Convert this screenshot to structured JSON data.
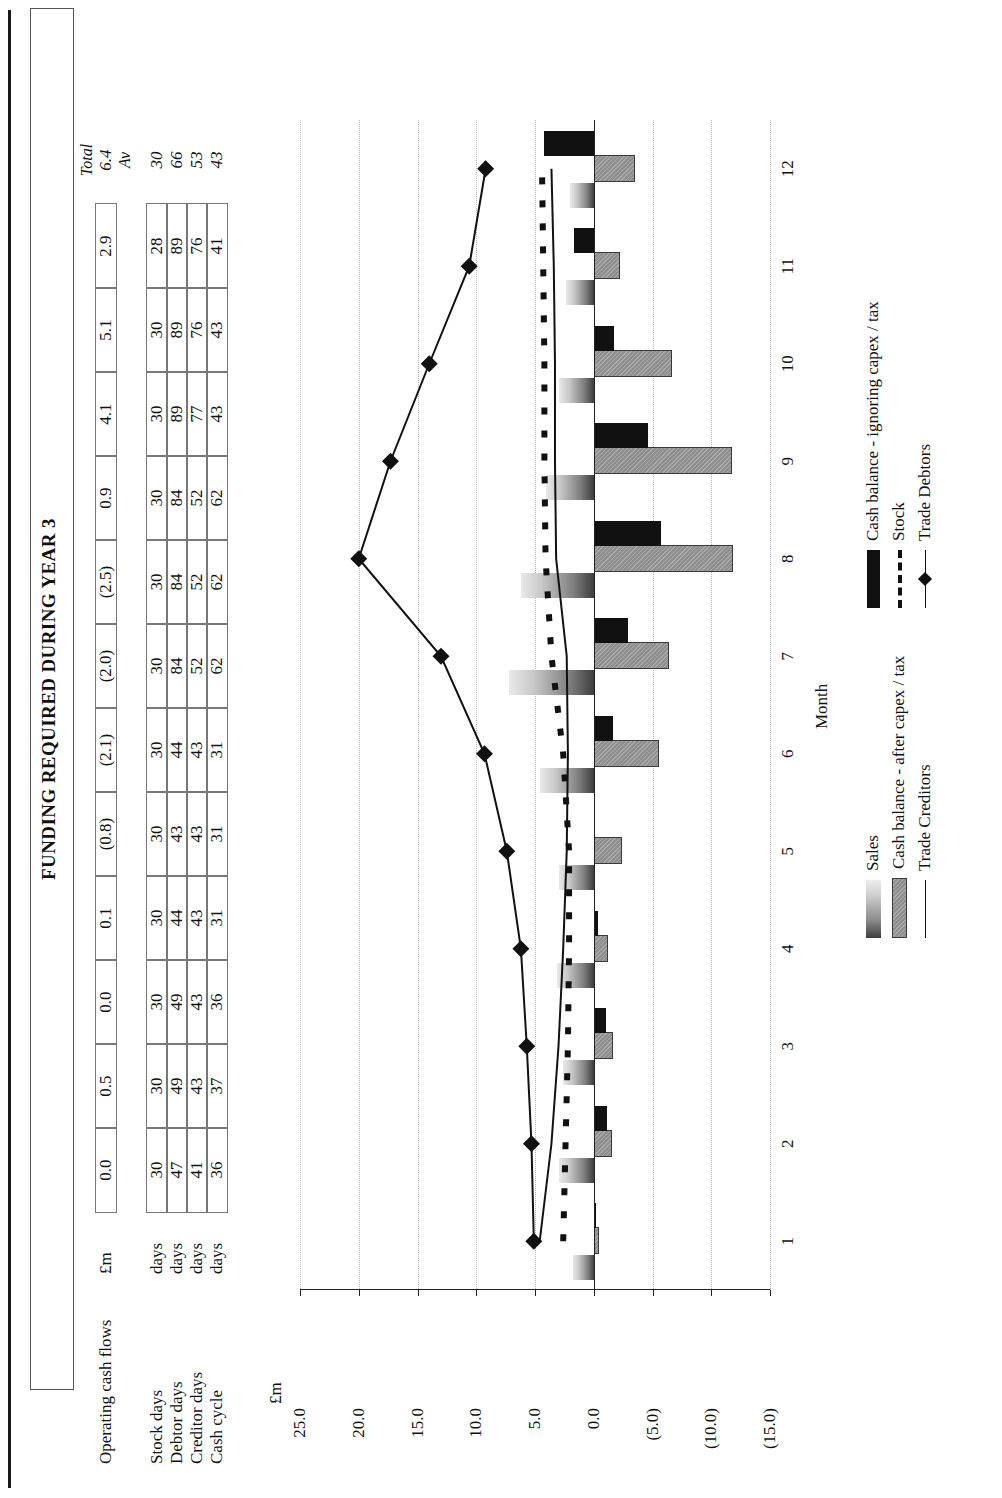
{
  "document": {
    "title": "FUNDING REQUIRED DURING YEAR 3"
  },
  "table": {
    "rows": [
      {
        "label": "Operating cash flows",
        "unit": "£m",
        "values": [
          "0.0",
          "0.5",
          "0.0",
          "0.1",
          "(0.8)",
          "(2.1)",
          "(2.0)",
          "(2.5)",
          "0.9",
          "4.1",
          "5.1",
          "2.9"
        ],
        "total": "6.4",
        "total_header": "Total"
      },
      {
        "label": "Stock days",
        "unit": "days",
        "values": [
          "30",
          "30",
          "30",
          "30",
          "30",
          "30",
          "30",
          "30",
          "30",
          "30",
          "30",
          "28"
        ],
        "total": "30",
        "total_header": "Av"
      },
      {
        "label": "Debtor days",
        "unit": "days",
        "values": [
          "47",
          "49",
          "49",
          "44",
          "43",
          "44",
          "84",
          "84",
          "84",
          "89",
          "89",
          "89"
        ],
        "total": "66",
        "total_header": ""
      },
      {
        "label": "Creditor days",
        "unit": "days",
        "values": [
          "41",
          "43",
          "43",
          "43",
          "43",
          "43",
          "52",
          "52",
          "52",
          "77",
          "76",
          "76"
        ],
        "total": "53",
        "total_header": ""
      },
      {
        "label": "Cash cycle",
        "unit": "days",
        "values": [
          "36",
          "37",
          "36",
          "31",
          "31",
          "31",
          "62",
          "62",
          "62",
          "43",
          "43",
          "41"
        ],
        "total": "43",
        "total_header": ""
      }
    ]
  },
  "chart_data": {
    "type": "bar",
    "title": "FUNDING REQUIRED DURING YEAR 3",
    "xlabel": "Month",
    "ylabel": "£m",
    "categories": [
      "1",
      "2",
      "3",
      "4",
      "5",
      "6",
      "7",
      "8",
      "9",
      "10",
      "11",
      "12"
    ],
    "ytick_labels": [
      "25.0",
      "20.0",
      "15.0",
      "10.0",
      "5.0",
      "0.0",
      "(5.0)",
      "(10.0)",
      "(15.0)"
    ],
    "ytick_values": [
      25,
      20,
      15,
      10,
      5,
      0,
      -5,
      -10,
      -15
    ],
    "ylim": [
      -15,
      25
    ],
    "grid": true,
    "legend_position": "bottom",
    "series": [
      {
        "name": "Sales",
        "type": "bar",
        "style": "gradient-grey",
        "values": [
          1.8,
          3.0,
          2.6,
          3.1,
          3.0,
          4.6,
          7.2,
          6.2,
          4.1,
          3.0,
          2.4,
          2.0
        ]
      },
      {
        "name": "Cash balance - after capex / tax",
        "type": "bar",
        "style": "hatched-grey",
        "values": [
          -0.3,
          -1.4,
          -1.5,
          -1.0,
          -2.2,
          -5.4,
          -6.2,
          -11.7,
          -11.6,
          -6.5,
          -2.1,
          -3.3
        ]
      },
      {
        "name": "Cash balance - ignoring capex / tax",
        "type": "bar",
        "style": "solid-black",
        "values": [
          -0.2,
          -1.1,
          -1.0,
          -0.4,
          0.0,
          -1.6,
          -2.9,
          -5.7,
          -4.6,
          -1.7,
          1.7,
          4.2
        ]
      },
      {
        "name": "Trade Creditors",
        "type": "line",
        "style": "solid",
        "values": [
          4.6,
          3.6,
          3.0,
          2.6,
          2.3,
          2.2,
          2.3,
          3.2,
          3.3,
          3.3,
          3.4,
          3.6
        ]
      },
      {
        "name": "Stock",
        "type": "line",
        "style": "dashed",
        "values": [
          2.6,
          2.4,
          2.2,
          2.1,
          2.1,
          2.6,
          3.6,
          4.1,
          4.2,
          4.2,
          4.3,
          4.4
        ]
      },
      {
        "name": "Trade Debtors",
        "type": "line",
        "style": "solid-diamond",
        "values": [
          5.1,
          5.3,
          5.7,
          6.2,
          7.4,
          9.3,
          13.0,
          20.0,
          17.3,
          14.0,
          10.6,
          9.2
        ]
      }
    ]
  },
  "legend": {
    "left_column": [
      {
        "label": "Sales",
        "key": "sales-swatch"
      },
      {
        "label": "Cash balance - after capex / tax",
        "key": "cash-after-swatch"
      },
      {
        "label": "Trade Creditors",
        "key": "trade-creditors-line"
      }
    ],
    "right_column": [
      {
        "label": "Cash balance - ignoring capex / tax",
        "key": "cash-ignoring-swatch"
      },
      {
        "label": "Stock",
        "key": "stock-dashed-line"
      },
      {
        "label": "Trade Debtors",
        "key": "trade-debtors-diamond-line"
      }
    ]
  },
  "axis": {
    "x_title": "Month",
    "y_unit": "£m"
  }
}
